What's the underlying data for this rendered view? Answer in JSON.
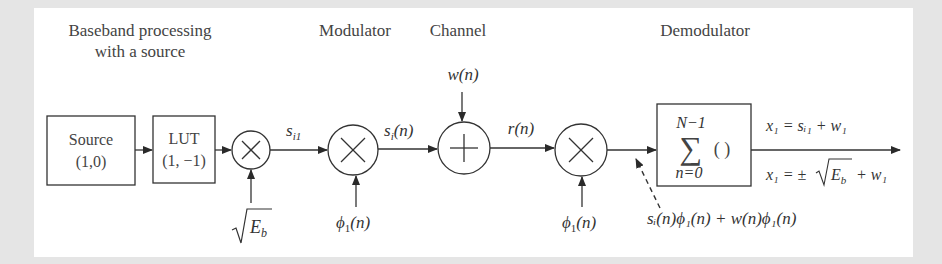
{
  "sections": {
    "baseband_line1": "Baseband processing",
    "baseband_line2": "with a source",
    "modulator": "Modulator",
    "channel": "Channel",
    "demodulator": "Demodulator"
  },
  "blocks": {
    "source": {
      "line1": "Source",
      "line2": "(1,0)"
    },
    "lut": {
      "line1": "LUT",
      "line2": "(1, −1)"
    },
    "summation": {
      "upper": "N−1",
      "sigma": "∑",
      "body": "( )",
      "lower": "n=0"
    }
  },
  "operators": {
    "mult1": "×",
    "mult2": "×",
    "adder": "+",
    "mult3": "×"
  },
  "signals": {
    "sqrt_eb": "E",
    "sqrt_eb_sub": "b",
    "si1": "s",
    "si1_sub": "i1",
    "si_n": "s",
    "si_n_sub": "i",
    "si_n_arg": "(n)",
    "w_n": "w(n)",
    "r_n": "r(n)",
    "phi1_mod": "ϕ",
    "phi1_mod_sub": "1",
    "phi1_mod_arg": "(n)",
    "phi1_demod": "ϕ",
    "phi1_demod_sub": "1",
    "phi1_demod_arg": "(n)",
    "product_label": "sᵢ(n)ϕ₁(n) + w(n)ϕ₁(n)",
    "out_eq1": "x₁ = sᵢ₁ + w₁",
    "out_eq2_prefix": "x₁ = ±",
    "out_eq2_rad": "E",
    "out_eq2_rad_sub": "b",
    "out_eq2_suffix": "+ w₁"
  },
  "colors": {
    "background": "#e5e5e5",
    "panel": "#ffffff",
    "stroke": "#333333",
    "text": "#444444"
  }
}
